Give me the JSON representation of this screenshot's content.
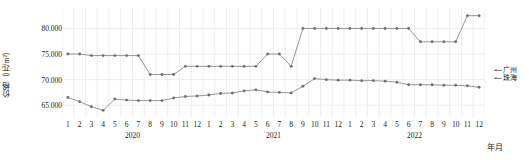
{
  "chart_data": {
    "type": "line",
    "title": "",
    "xlabel": "年月",
    "ylabel": "价格（元/m²）",
    "ylim": [
      62500,
      84000
    ],
    "yticks": [
      65000,
      70000,
      75000,
      80000
    ],
    "ytick_labels": [
      "65.000",
      "70.000",
      "75.000",
      "80.000"
    ],
    "grid": true,
    "legend_position": "right",
    "years": [
      {
        "label": "2020",
        "months": [
          "1",
          "2",
          "3",
          "4",
          "5",
          "6",
          "7",
          "8",
          "9",
          "10",
          "11",
          "12"
        ]
      },
      {
        "label": "2021",
        "months": [
          "1",
          "2",
          "3",
          "4",
          "5",
          "6",
          "7",
          "8",
          "9",
          "10",
          "11",
          "12"
        ]
      },
      {
        "label": "2022",
        "months": [
          "1",
          "2",
          "3",
          "4",
          "5",
          "6",
          "7",
          "8",
          "9",
          "10",
          "11",
          "12"
        ]
      }
    ],
    "x": [
      "2020-1",
      "2020-2",
      "2020-3",
      "2020-4",
      "2020-5",
      "2020-6",
      "2020-7",
      "2020-8",
      "2020-9",
      "2020-10",
      "2020-11",
      "2020-12",
      "2021-1",
      "2021-2",
      "2021-3",
      "2021-4",
      "2021-5",
      "2021-6",
      "2021-7",
      "2021-8",
      "2021-9",
      "2021-10",
      "2021-11",
      "2021-12",
      "2022-1",
      "2022-2",
      "2022-3",
      "2022-4",
      "2022-5",
      "2022-6",
      "2022-7",
      "2022-8",
      "2022-9",
      "2022-10",
      "2022-11",
      "2022-12"
    ],
    "series": [
      {
        "name": "广州",
        "color": "#8a8a92",
        "values": [
          75000,
          75000,
          74700,
          74700,
          74700,
          74700,
          74700,
          71000,
          71000,
          71000,
          72600,
          72600,
          72600,
          72600,
          72600,
          72600,
          72600,
          75000,
          75000,
          72600,
          80000,
          80000,
          80000,
          80000,
          80000,
          80000,
          80000,
          80000,
          80000,
          80000,
          77400,
          77400,
          77400,
          77400,
          82500,
          82500
        ]
      },
      {
        "name": "珠海",
        "color": "#8a8a92",
        "values": [
          66500,
          65700,
          64700,
          64000,
          66200,
          66000,
          65900,
          65900,
          65900,
          66400,
          66700,
          66800,
          67000,
          67300,
          67400,
          67800,
          68000,
          67600,
          67500,
          67400,
          68700,
          70200,
          70000,
          69900,
          69900,
          69800,
          69800,
          69700,
          69500,
          69000,
          69000,
          69000,
          68900,
          68900,
          68800,
          68500
        ]
      }
    ]
  },
  "legend": {
    "items": [
      {
        "label": "广州"
      },
      {
        "label": "珠海"
      }
    ]
  },
  "axis": {
    "y_title": "价格（元/m²）",
    "x_caption": "年月"
  }
}
